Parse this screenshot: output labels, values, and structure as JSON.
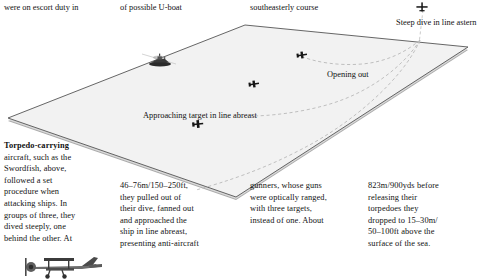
{
  "page": {
    "kind": "book-page-diagram",
    "background": "#ffffff",
    "ink": "#111111"
  },
  "top_text": {
    "col1": "were on escort duty in",
    "col2": "of possible U-boat",
    "col3": "southeasterly course"
  },
  "body_text": {
    "col1": {
      "lead": "Torpedo-carrying",
      "lines": [
        "aircraft, such as the",
        "Swordfish, above,",
        "followed a set",
        "procedure when",
        "attacking ships. In",
        "groups of three, they",
        "dived steeply, one",
        "behind the other. At"
      ],
      "italic_word": "above,"
    },
    "col2": {
      "lines": [
        "46–76m/150–250ft,",
        "they pulled out of",
        "their dive, fanned out",
        "and approached the",
        "ship in line abreast,",
        "presenting anti-aircraft"
      ]
    },
    "col3": {
      "lines": [
        "gunners, whose guns",
        "were optically ranged,",
        "with three targets,",
        "instead of one. About"
      ]
    },
    "col4": {
      "lines": [
        "823m/900yds before",
        "releasing their",
        "torpedoes they",
        "dropped to 15–30m/",
        "50–100ft above the",
        "surface of the sea."
      ]
    }
  },
  "diagram": {
    "labels": {
      "steep_dive": "Steep dive in line astern",
      "opening_out": "Opening out",
      "approaching": "Approaching target in line abreast"
    },
    "surface": {
      "fill": "#f2f2f2",
      "stroke": "#4a4a4a",
      "edge_shadow": "#6e6e6e",
      "vertices_label": "sea-surface-plane"
    },
    "track": {
      "style": "dashed",
      "color": "#b4b4b4",
      "count": 3
    },
    "icons": {
      "aircraft_diving": "aircraft-head-on-icon",
      "aircraft_level": "aircraft-plan-icon",
      "target_ship": "warship-icon",
      "swordfish_photo": "swordfish-biplane-illustration"
    }
  }
}
